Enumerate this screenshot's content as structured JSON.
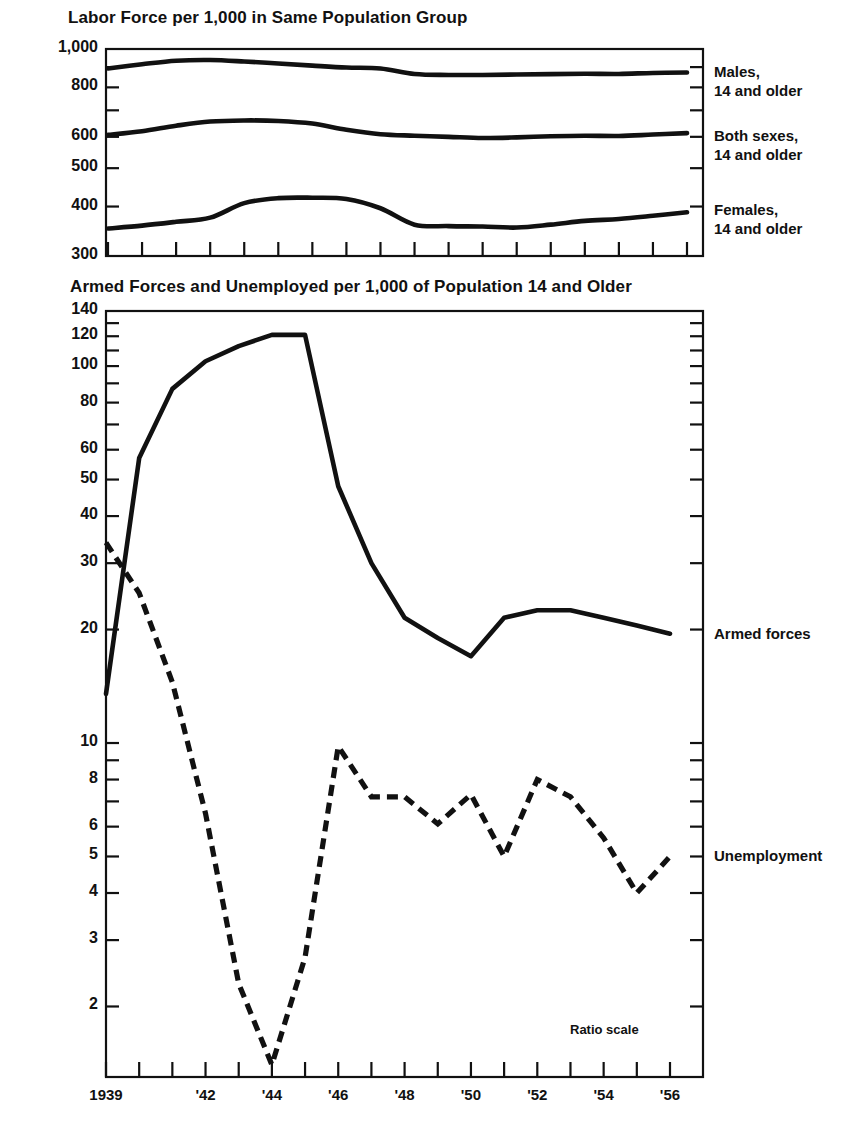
{
  "figure": {
    "background_color": "#ffffff",
    "ink_color": "#111111"
  },
  "top_chart": {
    "title": "Labor Force per 1,000 in Same Population Group",
    "ratio_scale": true,
    "y_tick_labels": [
      "1,000",
      "800",
      "600",
      "500",
      "400",
      "300"
    ],
    "series_labels": [
      {
        "line1": "Males,",
        "line2": "14 and older"
      },
      {
        "line1": "Both sexes,",
        "line2": "14 and older"
      },
      {
        "line1": "Females,",
        "line2": "14 and older"
      }
    ]
  },
  "bottom_chart": {
    "title": "Armed Forces and Unemployed per 1,000 of Population 14 and Older",
    "note": "Ratio scale",
    "y_tick_labels": [
      "140",
      "120",
      "100",
      "80",
      "60",
      "50",
      "40",
      "30",
      "20",
      "10",
      "8",
      "6",
      "5",
      "4",
      "3",
      "2"
    ],
    "x_tick_labels": [
      "1939",
      "",
      "",
      "'42",
      "",
      "'44",
      "",
      "'46",
      "",
      "'48",
      "",
      "'50",
      "",
      "'52",
      "",
      "'54",
      "",
      "'56"
    ],
    "series_labels": [
      "Armed forces",
      "Unemployment"
    ]
  },
  "chart_data": [
    {
      "type": "line",
      "title": "Labor Force per 1,000 in Same Population Group",
      "xlabel": "",
      "ylabel": "Labor force per 1,000",
      "yscale": "log",
      "ylim": [
        300,
        1000
      ],
      "yticks": [
        300,
        400,
        500,
        600,
        700,
        800,
        1000
      ],
      "ytick_labels": [
        "300",
        "400",
        "500",
        "600",
        "",
        "800",
        "1,000"
      ],
      "grid": false,
      "legend_position": "right",
      "x": [
        1939,
        1940,
        1941,
        1942,
        1943,
        1944,
        1945,
        1946,
        1947,
        1948,
        1949,
        1950,
        1951,
        1952,
        1953,
        1954,
        1955,
        1956
      ],
      "series": [
        {
          "name": "Males, 14 and older",
          "values": [
            893,
            915,
            934,
            938,
            930,
            919,
            908,
            898,
            893,
            865,
            860,
            860,
            862,
            864,
            866,
            865,
            870,
            872
          ]
        },
        {
          "name": "Both sexes, 14 and older",
          "values": [
            607,
            620,
            640,
            656,
            660,
            658,
            648,
            625,
            609,
            604,
            600,
            596,
            598,
            602,
            604,
            603,
            608,
            613
          ]
        },
        {
          "name": "Females, 14 and older",
          "values": [
            352,
            358,
            366,
            375,
            408,
            420,
            421,
            418,
            396,
            360,
            357,
            356,
            354,
            360,
            368,
            372,
            379,
            387
          ]
        }
      ]
    },
    {
      "type": "line",
      "title": "Armed Forces and Unemployed per 1,000 of Population 14 and Older",
      "xlabel": "",
      "ylabel": "Per 1,000 of population 14 and older",
      "yscale": "log",
      "ylim": [
        1.3,
        140
      ],
      "yticks": [
        2,
        3,
        4,
        5,
        6,
        8,
        10,
        20,
        30,
        40,
        50,
        60,
        80,
        100,
        120,
        140
      ],
      "ytick_labels": [
        "2",
        "3",
        "4",
        "5",
        "6",
        "8",
        "10",
        "20",
        "30",
        "40",
        "50",
        "60",
        "80",
        "100",
        "120",
        "140"
      ],
      "grid": false,
      "legend_position": "right",
      "note": "Ratio scale",
      "x": [
        1939,
        1940,
        1941,
        1942,
        1943,
        1944,
        1945,
        1946,
        1947,
        1948,
        1949,
        1950,
        1951,
        1952,
        1953,
        1954,
        1955,
        1956
      ],
      "series": [
        {
          "name": "Armed forces",
          "style": "solid",
          "values": [
            13.5,
            57,
            87,
            103,
            113,
            121,
            121,
            48,
            30,
            21.5,
            19,
            17,
            21.5,
            22.5,
            22.5,
            21.5,
            20.5,
            19.5
          ]
        },
        {
          "name": "Unemployment",
          "style": "dashed",
          "values": [
            34,
            25,
            14.5,
            6.5,
            2.3,
            1.4,
            2.7,
            9.8,
            7.2,
            7.2,
            6.1,
            7.3,
            5.0,
            8.0,
            7.2,
            5.6,
            4.0,
            5.0
          ]
        }
      ]
    }
  ]
}
